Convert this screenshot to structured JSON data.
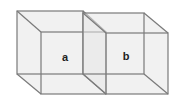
{
  "diagram": {
    "type": "two adjacent transparent wireframe cubes",
    "colors": {
      "edge": "#7a7a7a",
      "face": "#e6e6e6",
      "label": "#222222",
      "background": "#ffffff"
    },
    "cubes": [
      {
        "label": "a",
        "back": {
          "x1": 17,
          "y1": 11,
          "x2": 83,
          "y2": 74
        },
        "front": {
          "x1": 41,
          "y1": 32,
          "x2": 106,
          "y2": 94
        },
        "label_pos": {
          "x": 65,
          "y": 61
        }
      },
      {
        "label": "b",
        "back": {
          "x1": 83,
          "y1": 13,
          "x2": 144,
          "y2": 74
        },
        "front": {
          "x1": 106,
          "y1": 33,
          "x2": 168,
          "y2": 94
        },
        "label_pos": {
          "x": 126,
          "y": 60
        }
      }
    ]
  }
}
